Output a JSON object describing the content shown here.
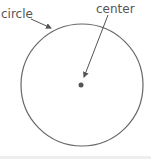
{
  "diagram": {
    "labels": {
      "circle": "circle",
      "center": "center"
    },
    "shapes": {
      "circle": {
        "cx": 82,
        "cy": 85,
        "r": 61,
        "stroke": "#666666"
      },
      "center_dot": {
        "cx": 81,
        "cy": 85,
        "r": 2.5,
        "fill": "#555555"
      }
    },
    "arrows": [
      {
        "from_label": "circle",
        "x1": 31,
        "y1": 19,
        "x2": 51,
        "y2": 28
      },
      {
        "from_label": "center",
        "x1": 108,
        "y1": 15,
        "x2": 84,
        "y2": 77
      }
    ]
  }
}
